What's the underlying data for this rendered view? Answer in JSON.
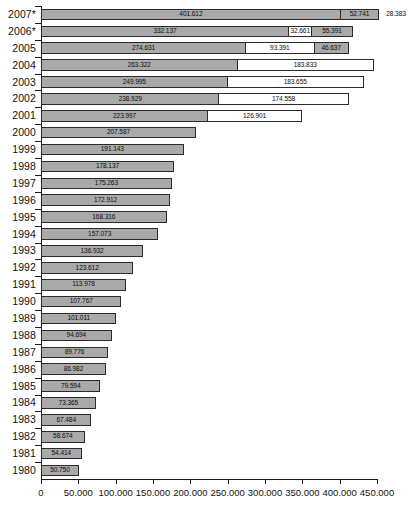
{
  "chart_data": {
    "type": "bar",
    "orientation": "horizontal",
    "stacked": true,
    "title": "",
    "subtitle": "",
    "xlabel": "",
    "ylabel": "",
    "xlim": [
      0,
      450000
    ],
    "grid": false,
    "legend_position": "none",
    "x_ticks": [
      "0",
      "50.000",
      "100.000",
      "150.000",
      "200.000",
      "250.000",
      "300.000",
      "350.000",
      "400.000",
      "450.000"
    ],
    "x_tick_values": [
      0,
      50000,
      100000,
      150000,
      200000,
      250000,
      300000,
      350000,
      400000,
      450000
    ],
    "categories": [
      "2007*",
      "2006*",
      "2005",
      "2004",
      "2003",
      "2002",
      "2001",
      "2000",
      "1999",
      "1998",
      "1997",
      "1996",
      "1995",
      "1994",
      "1993",
      "1992",
      "1991",
      "1990",
      "1989",
      "1988",
      "1987",
      "1986",
      "1985",
      "1984",
      "1983",
      "1982",
      "1981",
      "1980"
    ],
    "series": [
      {
        "name": "segment-1",
        "color": "#a9a9a9",
        "values": [
          401612,
          332137,
          274631,
          263322,
          249995,
          238929,
          223997,
          207587,
          191143,
          178137,
          175263,
          172912,
          168316,
          157073,
          136932,
          123612,
          113978,
          107767,
          101011,
          94694,
          89776,
          86982,
          79594,
          73365,
          67484,
          58674,
          54414,
          50750
        ],
        "labels": [
          "401.612",
          "332.137",
          "274.631",
          "263.322",
          "249.995",
          "238.929",
          "223.997",
          "207.587",
          "191.143",
          "178.137",
          "175.263",
          "172.912",
          "168.316",
          "157.073",
          "136.932",
          "123.612",
          "113.978",
          "107.767",
          "101.011",
          "94.694",
          "89.776",
          "86.982",
          "79.594",
          "73.365",
          "67.484",
          "58.674",
          "54.414",
          "50.750"
        ]
      },
      {
        "name": "segment-2",
        "color": "#ffffff",
        "values": [
          52741,
          32661,
          93391,
          183833,
          183655,
          174558,
          126901,
          null,
          null,
          null,
          null,
          null,
          null,
          null,
          null,
          null,
          null,
          null,
          null,
          null,
          null,
          null,
          null,
          null,
          null,
          null,
          null,
          null
        ],
        "labels": [
          "52.741",
          "32.661",
          "93.391",
          "183.833",
          "183.655",
          "174.558",
          "126.901",
          "",
          "",
          "",
          "",
          "",
          "",
          "",
          "",
          "",
          "",
          "",
          "",
          "",
          "",
          "",
          "",
          "",
          "",
          "",
          "",
          ""
        ]
      },
      {
        "name": "segment-3",
        "color": "#a9a9a9",
        "values": [
          28383,
          55391,
          46637,
          null,
          null,
          null,
          null,
          null,
          null,
          null,
          null,
          null,
          null,
          null,
          null,
          null,
          null,
          null,
          null,
          null,
          null,
          null,
          null,
          null,
          null,
          null,
          null,
          null
        ],
        "labels": [
          "28.383",
          "55.391",
          "46.637",
          "",
          "",
          "",
          "",
          "",
          "",
          "",
          "",
          "",
          "",
          "",
          "",
          "",
          "",
          "",
          "",
          "",
          "",
          "",
          "",
          "",
          "",
          "",
          "",
          ""
        ]
      }
    ],
    "rows": [
      {
        "category": "2007*",
        "segments": [
          {
            "label": "401.612",
            "value": 401612,
            "fill": "gray",
            "label_position": "inside"
          },
          {
            "label": "52.741",
            "value": 52741,
            "fill": "gray-light",
            "label_position": "inside"
          },
          {
            "label": "28.383",
            "value": 28383,
            "fill": "none",
            "label_position": "outside"
          }
        ]
      },
      {
        "category": "2006*",
        "segments": [
          {
            "label": "332.137",
            "value": 332137,
            "fill": "gray",
            "label_position": "inside"
          },
          {
            "label": "32.661",
            "value": 32661,
            "fill": "white",
            "label_position": "inside"
          },
          {
            "label": "55.391",
            "value": 55391,
            "fill": "gray",
            "label_position": "inside"
          }
        ]
      },
      {
        "category": "2005",
        "segments": [
          {
            "label": "274.631",
            "value": 274631,
            "fill": "gray",
            "label_position": "inside"
          },
          {
            "label": "93.391",
            "value": 93391,
            "fill": "white",
            "label_position": "inside"
          },
          {
            "label": "46.637",
            "value": 46637,
            "fill": "gray",
            "label_position": "inside"
          }
        ]
      },
      {
        "category": "2004",
        "segments": [
          {
            "label": "263.322",
            "value": 263322,
            "fill": "gray",
            "label_position": "inside"
          },
          {
            "label": "183.833",
            "value": 183833,
            "fill": "white",
            "label_position": "inside"
          }
        ]
      },
      {
        "category": "2003",
        "segments": [
          {
            "label": "249.995",
            "value": 249995,
            "fill": "gray",
            "label_position": "inside"
          },
          {
            "label": "183.655",
            "value": 183655,
            "fill": "white",
            "label_position": "inside"
          }
        ]
      },
      {
        "category": "2002",
        "segments": [
          {
            "label": "238.929",
            "value": 238929,
            "fill": "gray",
            "label_position": "inside"
          },
          {
            "label": "174.558",
            "value": 174558,
            "fill": "white",
            "label_position": "inside"
          }
        ]
      },
      {
        "category": "2001",
        "segments": [
          {
            "label": "223.997",
            "value": 223997,
            "fill": "gray",
            "label_position": "inside"
          },
          {
            "label": "126.901",
            "value": 126901,
            "fill": "white",
            "label_position": "inside"
          }
        ]
      },
      {
        "category": "2000",
        "segments": [
          {
            "label": "207.587",
            "value": 207587,
            "fill": "gray",
            "label_position": "inside"
          }
        ]
      },
      {
        "category": "1999",
        "segments": [
          {
            "label": "191.143",
            "value": 191143,
            "fill": "gray",
            "label_position": "inside"
          }
        ]
      },
      {
        "category": "1998",
        "segments": [
          {
            "label": "178.137",
            "value": 178137,
            "fill": "gray",
            "label_position": "inside"
          }
        ]
      },
      {
        "category": "1997",
        "segments": [
          {
            "label": "175.263",
            "value": 175263,
            "fill": "gray",
            "label_position": "inside"
          }
        ]
      },
      {
        "category": "1996",
        "segments": [
          {
            "label": "172.912",
            "value": 172912,
            "fill": "gray",
            "label_position": "inside"
          }
        ]
      },
      {
        "category": "1995",
        "segments": [
          {
            "label": "168.316",
            "value": 168316,
            "fill": "gray",
            "label_position": "inside"
          }
        ]
      },
      {
        "category": "1994",
        "segments": [
          {
            "label": "157.073",
            "value": 157073,
            "fill": "gray",
            "label_position": "inside"
          }
        ]
      },
      {
        "category": "1993",
        "segments": [
          {
            "label": "136.932",
            "value": 136932,
            "fill": "gray",
            "label_position": "inside"
          }
        ]
      },
      {
        "category": "1992",
        "segments": [
          {
            "label": "123.612",
            "value": 123612,
            "fill": "gray",
            "label_position": "inside"
          }
        ]
      },
      {
        "category": "1991",
        "segments": [
          {
            "label": "113.978",
            "value": 113978,
            "fill": "gray",
            "label_position": "inside"
          }
        ]
      },
      {
        "category": "1990",
        "segments": [
          {
            "label": "107.767",
            "value": 107767,
            "fill": "gray",
            "label_position": "inside"
          }
        ]
      },
      {
        "category": "1989",
        "segments": [
          {
            "label": "101.011",
            "value": 101011,
            "fill": "gray",
            "label_position": "inside"
          }
        ]
      },
      {
        "category": "1988",
        "segments": [
          {
            "label": "94.694",
            "value": 94694,
            "fill": "gray",
            "label_position": "inside"
          }
        ]
      },
      {
        "category": "1987",
        "segments": [
          {
            "label": "89.776",
            "value": 89776,
            "fill": "gray",
            "label_position": "inside"
          }
        ]
      },
      {
        "category": "1986",
        "segments": [
          {
            "label": "86.982",
            "value": 86982,
            "fill": "gray",
            "label_position": "inside"
          }
        ]
      },
      {
        "category": "1985",
        "segments": [
          {
            "label": "79.594",
            "value": 79594,
            "fill": "gray",
            "label_position": "inside"
          }
        ]
      },
      {
        "category": "1984",
        "segments": [
          {
            "label": "73.365",
            "value": 73365,
            "fill": "gray",
            "label_position": "inside"
          }
        ]
      },
      {
        "category": "1983",
        "segments": [
          {
            "label": "67.484",
            "value": 67484,
            "fill": "gray",
            "label_position": "inside"
          }
        ]
      },
      {
        "category": "1982",
        "segments": [
          {
            "label": "58.674",
            "value": 58674,
            "fill": "gray",
            "label_position": "inside"
          }
        ]
      },
      {
        "category": "1981",
        "segments": [
          {
            "label": "54.414",
            "value": 54414,
            "fill": "gray",
            "label_position": "inside"
          }
        ]
      },
      {
        "category": "1980",
        "segments": [
          {
            "label": "50.750",
            "value": 50750,
            "fill": "gray",
            "label_position": "inside"
          }
        ]
      }
    ],
    "colors": {
      "bar_gray": "#a9a9a9",
      "bar_white": "#ffffff",
      "bar_border": "#2b2b2b",
      "axis": "#1a1a1a",
      "text": "#111111",
      "background": "#ffffff"
    }
  }
}
